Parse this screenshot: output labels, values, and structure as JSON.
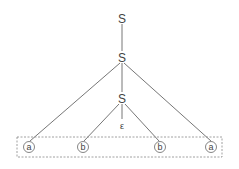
{
  "diagram": {
    "type": "parse-tree",
    "nodes": {
      "root": {
        "label": "S"
      },
      "s1": {
        "label": "S"
      },
      "s2": {
        "label": "S"
      },
      "eps": {
        "label": "ε"
      },
      "leaf1": {
        "label": "a"
      },
      "leaf2": {
        "label": "b"
      },
      "leaf3": {
        "label": "b"
      },
      "leaf4": {
        "label": "a"
      }
    },
    "edges": [
      [
        "root",
        "s1"
      ],
      [
        "s1",
        "leaf1"
      ],
      [
        "s1",
        "s2"
      ],
      [
        "s1",
        "leaf4"
      ],
      [
        "s2",
        "leaf2"
      ],
      [
        "s2",
        "eps"
      ],
      [
        "s2",
        "leaf3"
      ]
    ],
    "leaf_box": {
      "style": "dashed",
      "encloses": [
        "leaf1",
        "leaf2",
        "leaf3",
        "leaf4"
      ]
    },
    "colors": {
      "line": "#555555",
      "text": "#444444",
      "box": "#888888"
    }
  }
}
